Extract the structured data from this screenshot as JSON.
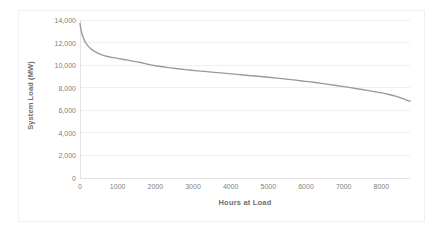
{
  "chart_data": {
    "type": "line",
    "title": "",
    "xlabel": "Hours at Load",
    "ylabel": "System Load (MW)",
    "xlim": [
      0,
      8760
    ],
    "ylim": [
      0,
      14000
    ],
    "grid": "horizontal",
    "legend": "none",
    "line_color": "#9a9a9a",
    "x_tick_labels": [
      "0",
      "1000",
      "2000",
      "3000",
      "4000",
      "5000",
      "6000",
      "7000",
      "8000"
    ],
    "x_tick_values": [
      0,
      1000,
      2000,
      3000,
      4000,
      5000,
      6000,
      7000,
      8000
    ],
    "y_tick_labels": [
      "0",
      "2,000",
      "4,000",
      "6,000",
      "8,000",
      "10,000",
      "12,000",
      "14,000"
    ],
    "y_tick_values": [
      0,
      2000,
      4000,
      6000,
      8000,
      10000,
      12000,
      14000
    ],
    "series": [
      {
        "name": "System Load Duration Curve",
        "x": [
          0,
          20,
          50,
          90,
          140,
          200,
          280,
          370,
          470,
          580,
          700,
          840,
          1000,
          1200,
          1400,
          1600,
          1800,
          2000,
          2300,
          2600,
          2900,
          3200,
          3500,
          3800,
          4100,
          4400,
          4700,
          5000,
          5300,
          5600,
          5900,
          6200,
          6500,
          6800,
          7100,
          7400,
          7700,
          8000,
          8200,
          8400,
          8550,
          8650,
          8760
        ],
        "y": [
          13700,
          13250,
          12800,
          12400,
          12050,
          11750,
          11480,
          11250,
          11060,
          10910,
          10790,
          10690,
          10600,
          10480,
          10360,
          10230,
          10080,
          9950,
          9800,
          9680,
          9570,
          9470,
          9380,
          9290,
          9200,
          9110,
          9020,
          8930,
          8830,
          8720,
          8600,
          8480,
          8340,
          8200,
          8050,
          7890,
          7720,
          7540,
          7400,
          7230,
          7060,
          6930,
          6800
        ]
      }
    ]
  },
  "axis_titles": {
    "x": "Hours at Load",
    "y": "System Load (MW)"
  }
}
